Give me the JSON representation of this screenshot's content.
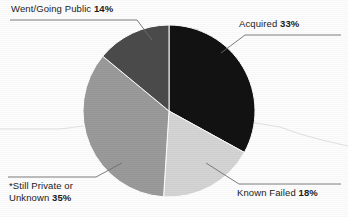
{
  "chart_data": {
    "type": "pie",
    "title": "",
    "labels": [
      "Acquired",
      "Known Failed",
      "*Still Private or Unknown",
      "Went/Going Public"
    ],
    "values": [
      33,
      18,
      35,
      14
    ],
    "value_suffix": "%",
    "colors": [
      "#121212",
      "#d4d4d4",
      "#9a9a9a",
      "#4b4b4b"
    ],
    "legend": "none",
    "grid": false,
    "slices": [
      {
        "name": "Acquired",
        "value": 33,
        "value_text": "33%",
        "label_text": "Acquired",
        "color": "#121212",
        "start_angle": 0,
        "end_angle": 118.8
      },
      {
        "name": "Known Failed",
        "value": 18,
        "value_text": "18%",
        "label_text": "Known Failed",
        "color": "#d4d4d4",
        "start_angle": 118.8,
        "end_angle": 183.6
      },
      {
        "name": "Still Private or Unknown",
        "value": 35,
        "value_text": "35%",
        "label_text": "*Still Private or Unknown",
        "color": "#9a9a9a",
        "start_angle": 183.6,
        "end_angle": 309.6
      },
      {
        "name": "Went/Going Public",
        "value": 14,
        "value_text": "14%",
        "label_text": "Went/Going Public",
        "color": "#4b4b4b",
        "start_angle": 309.6,
        "end_angle": 360
      }
    ]
  },
  "labels": {
    "public": {
      "text": "Went/Going Public",
      "percent": "14%"
    },
    "acquired": {
      "text": "Acquired",
      "percent": "33%"
    },
    "failed": {
      "text": "Known Failed",
      "percent": "18%"
    },
    "private": {
      "line1": "*Still Private or",
      "line2_text": "Unknown",
      "percent": "35%"
    }
  }
}
